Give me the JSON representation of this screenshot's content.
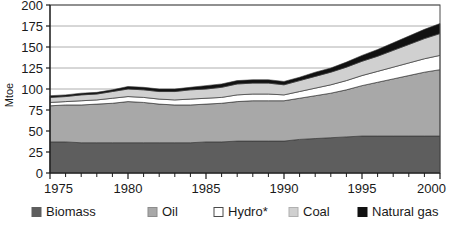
{
  "chart_data": {
    "type": "area",
    "stacked": true,
    "title": "",
    "subtitle": "",
    "xlabel": "",
    "ylabel": "Mtoe",
    "xlim": [
      1975,
      2000
    ],
    "ylim": [
      0,
      200
    ],
    "ytick_step": 25,
    "yticks": [
      0,
      25,
      50,
      75,
      100,
      125,
      150,
      175,
      200
    ],
    "ytick_labels": [
      "0",
      "25",
      "50",
      "75",
      "100",
      "125",
      "150",
      "175",
      "200"
    ],
    "xticks": [
      1975,
      1980,
      1985,
      1990,
      1995,
      2000
    ],
    "xtick_labels": [
      "1975",
      "1980",
      "1985",
      "1990",
      "1995",
      "2000"
    ],
    "x_minor_tick_step": 1,
    "grid": "horizontal",
    "legend_position": "bottom",
    "x": [
      1975,
      1976,
      1977,
      1978,
      1979,
      1980,
      1981,
      1982,
      1983,
      1984,
      1985,
      1986,
      1987,
      1988,
      1989,
      1990,
      1991,
      1992,
      1993,
      1994,
      1995,
      1996,
      1997,
      1998,
      1999,
      2000
    ],
    "series": [
      {
        "name": "Biomass",
        "color": "#5e5e5e",
        "values": [
          37,
          37,
          36,
          36,
          36,
          36,
          36,
          36,
          36,
          36,
          37,
          37,
          38,
          38,
          38,
          38,
          40,
          41,
          42,
          43,
          44,
          44,
          44,
          44,
          44,
          44
        ]
      },
      {
        "name": "Oil",
        "color": "#a8a8a8",
        "values": [
          43,
          44,
          45,
          46,
          47,
          49,
          48,
          46,
          45,
          45,
          45,
          46,
          47,
          48,
          48,
          48,
          49,
          51,
          53,
          56,
          60,
          64,
          68,
          72,
          76,
          79
        ]
      },
      {
        "name": "Hydro*",
        "color": "#ffffff",
        "values": [
          4,
          4,
          5,
          5,
          6,
          6,
          6,
          6,
          6,
          7,
          7,
          7,
          8,
          8,
          8,
          7,
          8,
          9,
          10,
          11,
          12,
          13,
          14,
          15,
          16,
          17
        ]
      },
      {
        "name": "Coal",
        "color": "#d0d0d0",
        "values": [
          6,
          6,
          7,
          7,
          8,
          9,
          9,
          9,
          10,
          11,
          11,
          12,
          13,
          13,
          13,
          12,
          13,
          14,
          15,
          16,
          17,
          18,
          20,
          22,
          24,
          26
        ]
      },
      {
        "name": "Natural gas",
        "color": "#111111",
        "values": [
          2,
          2,
          2,
          2,
          2,
          3,
          3,
          3,
          3,
          3,
          4,
          4,
          4,
          4,
          4,
          4,
          4,
          5,
          5,
          6,
          7,
          8,
          9,
          10,
          11,
          12
        ]
      }
    ],
    "totals": [
      92,
      93,
      95,
      96,
      99,
      103,
      102,
      100,
      100,
      102,
      104,
      106,
      110,
      111,
      111,
      109,
      114,
      120,
      125,
      132,
      140,
      147,
      155,
      163,
      171,
      178
    ],
    "footnote_marker": "*"
  },
  "legend": {
    "items": [
      {
        "label": "Biomass",
        "swatch": "#5e5e5e",
        "border": "#5e5e5e"
      },
      {
        "label": "Oil",
        "swatch": "#a8a8a8",
        "border": "#8c8c8c"
      },
      {
        "label": "Hydro*",
        "swatch": "#ffffff",
        "border": "#4a4a4a"
      },
      {
        "label": "Coal",
        "swatch": "#d0d0d0",
        "border": "#b0b0b0"
      },
      {
        "label": "Natural gas",
        "swatch": "#111111",
        "border": "#111111"
      }
    ]
  },
  "colors": {
    "axis": "#1a1a1a",
    "gridline": "#9a9a9a",
    "plot_border": "#4a4a4a",
    "background": "#ffffff",
    "series_outline": "#3a3a3a"
  }
}
